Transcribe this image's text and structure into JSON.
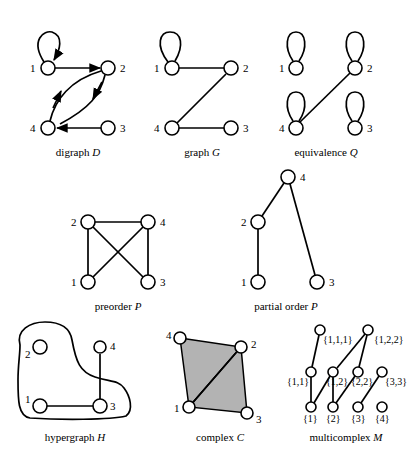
{
  "panels": {
    "digraph": {
      "caption_text": "digraph",
      "caption_symbol": "D",
      "nodes": [
        "1",
        "2",
        "3",
        "4"
      ],
      "edges": [
        [
          "1",
          "1"
        ],
        [
          "1",
          "2"
        ],
        [
          "2",
          "4"
        ],
        [
          "4",
          "2"
        ],
        [
          "3",
          "4"
        ]
      ],
      "directed": true
    },
    "graph": {
      "caption_text": "graph",
      "caption_symbol": "G",
      "nodes": [
        "1",
        "2",
        "3",
        "4"
      ],
      "edges": [
        [
          "1",
          "1"
        ],
        [
          "1",
          "2"
        ],
        [
          "2",
          "4"
        ],
        [
          "4",
          "3"
        ]
      ]
    },
    "equivalence": {
      "caption_text": "equivalence",
      "caption_symbol": "Q",
      "nodes": [
        "1",
        "2",
        "3",
        "4"
      ],
      "edges": [
        [
          "1",
          "1"
        ],
        [
          "2",
          "2"
        ],
        [
          "3",
          "3"
        ],
        [
          "4",
          "4"
        ],
        [
          "2",
          "4"
        ]
      ]
    },
    "preorder": {
      "caption_text": "preorder",
      "caption_symbol": "P",
      "nodes": [
        "1",
        "2",
        "3",
        "4"
      ],
      "edges": [
        [
          "2",
          "4"
        ],
        [
          "2",
          "1"
        ],
        [
          "4",
          "3"
        ],
        [
          "2",
          "3"
        ],
        [
          "4",
          "1"
        ]
      ]
    },
    "partial_order": {
      "caption_text": "partial order",
      "caption_symbol": "P",
      "nodes": [
        "1",
        "2",
        "3",
        "4"
      ],
      "edges": [
        [
          "4",
          "2"
        ],
        [
          "2",
          "1"
        ],
        [
          "4",
          "3"
        ]
      ]
    },
    "hypergraph": {
      "caption_text": "hypergraph",
      "caption_symbol": "H",
      "nodes": [
        "1",
        "2",
        "3",
        "4"
      ],
      "edges": [
        [
          "1",
          "3"
        ],
        [
          "3",
          "4"
        ]
      ],
      "hyperedges": [
        [
          "1",
          "2",
          "3"
        ]
      ]
    },
    "complex": {
      "caption_text": "complex",
      "caption_symbol": "C",
      "nodes": [
        "1",
        "2",
        "3",
        "4"
      ],
      "faces": [
        [
          "1",
          "2",
          "4"
        ],
        [
          "1",
          "2",
          "3"
        ]
      ]
    },
    "multicomplex": {
      "caption_text": "multicomplex",
      "caption_symbol": "M",
      "top": [
        "{1,1,1}",
        "{1,2,2}"
      ],
      "middle": [
        "{1,1}",
        "{1,2}",
        "{2,2}",
        "{3,3}"
      ],
      "bottom": [
        "{1}",
        "{2}",
        "{3}",
        "{4}"
      ]
    }
  }
}
